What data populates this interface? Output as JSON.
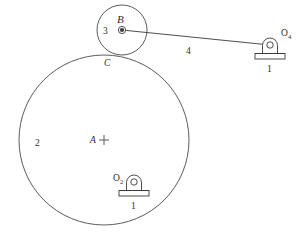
{
  "figure": {
    "kind": "kinematic-mechanism-diagram",
    "background_color": "#ffffff",
    "line_color": "#3a3a3a",
    "text_color": "#2e2e2e",
    "width": 305,
    "height": 238
  },
  "labels": {
    "link_ground_left": "1",
    "link_ground_right": "1",
    "link_big_wheel": "2",
    "link_small_wheel": "3",
    "link_connecting_rod": "4",
    "point_b": "B",
    "point_c": "C",
    "point_a": "A",
    "pivot_o2_base": "O",
    "pivot_o2_sub": "2",
    "pivot_o4_base": "O",
    "pivot_o4_sub": "4"
  },
  "geometry": {
    "big_circle": {
      "cx": 104,
      "cy": 140,
      "r": 85
    },
    "small_circle": {
      "cx": 122,
      "cy": 30,
      "r": 25
    },
    "contact_point_c": {
      "x": 108,
      "y": 55
    },
    "center_mark_a": {
      "x": 104,
      "y": 140
    },
    "pivot_b": {
      "x": 122,
      "y": 30
    },
    "pivot_o2": {
      "x": 134,
      "y": 182
    },
    "pivot_o4": {
      "x": 270,
      "y": 45
    },
    "connecting_rod": {
      "x1": 122,
      "y1": 30,
      "x2": 270,
      "y2": 45
    }
  }
}
